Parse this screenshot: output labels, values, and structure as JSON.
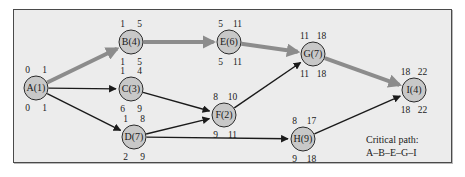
{
  "figure": {
    "background_color": "#ececec",
    "frame_color": "#4a4a4a",
    "node_fill": "#c8c8c8",
    "node_stroke": "#2b2b2b",
    "edge_color": "#1a1a1a",
    "critical_edge_color": "#8c8c8c"
  },
  "caption": {
    "line1": "Critical path:",
    "line2": "A–B–E–G–I"
  },
  "chart_data": {
    "type": "diagram",
    "legend": [
      "Critical path: A–B–E–G–I"
    ],
    "critical_path": [
      "A",
      "B",
      "E",
      "G",
      "I"
    ],
    "nodes": [
      {
        "id": "A",
        "label": "A(1)",
        "duration": 1,
        "cx": 36,
        "cy": 88,
        "r": 12,
        "early_start": 0,
        "early_finish": 1,
        "late_start": 0,
        "late_finish": 1,
        "top_left": "0",
        "top_right": "1",
        "bottom_left": "0",
        "bottom_right": "1",
        "on_critical_path": true
      },
      {
        "id": "B",
        "label": "B(4)",
        "duration": 4,
        "cx": 131,
        "cy": 42,
        "r": 12,
        "early_start": 1,
        "early_finish": 5,
        "late_start": 1,
        "late_finish": 5,
        "top_left": "1",
        "top_right": "5",
        "bottom_left": "1",
        "bottom_right": "5",
        "on_critical_path": true
      },
      {
        "id": "C",
        "label": "C(3)",
        "duration": 3,
        "cx": 131,
        "cy": 89,
        "r": 12,
        "early_start": 1,
        "early_finish": 4,
        "late_start": 6,
        "late_finish": 9,
        "top_left": "1",
        "top_right": "4",
        "bottom_left": "6",
        "bottom_right": "9",
        "on_critical_path": false
      },
      {
        "id": "D",
        "label": "D(7)",
        "duration": 7,
        "cx": 134,
        "cy": 137,
        "r": 12,
        "early_start": 1,
        "early_finish": 8,
        "late_start": 2,
        "late_finish": 9,
        "top_left": "1",
        "top_right": "8",
        "bottom_left": "2",
        "bottom_right": "9",
        "on_critical_path": false
      },
      {
        "id": "E",
        "label": "E(6)",
        "duration": 6,
        "cx": 229,
        "cy": 42,
        "r": 12,
        "early_start": 5,
        "early_finish": 11,
        "late_start": 5,
        "late_finish": 11,
        "top_left": "5",
        "top_right": "11",
        "bottom_left": "5",
        "bottom_right": "11",
        "on_critical_path": true
      },
      {
        "id": "F",
        "label": "F(2)",
        "duration": 2,
        "cx": 224,
        "cy": 115,
        "r": 12,
        "early_start": 8,
        "early_finish": 10,
        "late_start": 9,
        "late_finish": 11,
        "top_left": "8",
        "top_right": "10",
        "bottom_left": "9",
        "bottom_right": "11",
        "on_critical_path": false
      },
      {
        "id": "G",
        "label": "G(7)",
        "duration": 7,
        "cx": 313,
        "cy": 54,
        "r": 12,
        "early_start": 11,
        "early_finish": 18,
        "late_start": 11,
        "late_finish": 18,
        "top_left": "11",
        "top_right": "18",
        "bottom_left": "11",
        "bottom_right": "18",
        "on_critical_path": true
      },
      {
        "id": "H",
        "label": "H(9)",
        "duration": 9,
        "cx": 303,
        "cy": 139,
        "r": 12,
        "early_start": 8,
        "early_finish": 17,
        "late_start": 9,
        "late_finish": 18,
        "top_left": "8",
        "top_right": "17",
        "bottom_left": "9",
        "bottom_right": "18",
        "on_critical_path": false
      },
      {
        "id": "I",
        "label": "I(4)",
        "duration": 4,
        "cx": 414,
        "cy": 90,
        "r": 12,
        "early_start": 18,
        "early_finish": 22,
        "late_start": 18,
        "late_finish": 22,
        "top_left": "18",
        "top_right": "22",
        "bottom_left": "18",
        "bottom_right": "22",
        "on_critical_path": true
      }
    ],
    "edges": [
      {
        "from": "A",
        "to": "B",
        "critical": true
      },
      {
        "from": "A",
        "to": "C",
        "critical": false
      },
      {
        "from": "A",
        "to": "D",
        "critical": false
      },
      {
        "from": "B",
        "to": "E",
        "critical": true
      },
      {
        "from": "C",
        "to": "F",
        "critical": false
      },
      {
        "from": "D",
        "to": "F",
        "critical": false
      },
      {
        "from": "D",
        "to": "H",
        "critical": false
      },
      {
        "from": "E",
        "to": "G",
        "critical": true
      },
      {
        "from": "F",
        "to": "G",
        "critical": false
      },
      {
        "from": "G",
        "to": "I",
        "critical": true
      },
      {
        "from": "H",
        "to": "I",
        "critical": false
      }
    ]
  }
}
